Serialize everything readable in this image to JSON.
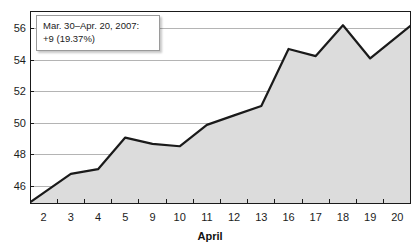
{
  "chart_data": {
    "type": "area",
    "title": "",
    "subtitle": "",
    "xlabel": "April",
    "ylabel": "",
    "categories": [
      "2",
      "3",
      "4",
      "5",
      "9",
      "10",
      "11",
      "12",
      "13",
      "16",
      "17",
      "18",
      "19",
      "20"
    ],
    "x_tick_labels": [
      "2",
      "3",
      "4",
      "5",
      "9",
      "10",
      "11",
      "12",
      "13",
      "16",
      "17",
      "18",
      "19",
      "20"
    ],
    "y_tick_labels": [
      "46",
      "48",
      "50",
      "52",
      "54",
      "56"
    ],
    "y_ticks": [
      46,
      48,
      50,
      52,
      54,
      56
    ],
    "ylim": [
      44.9,
      57.1
    ],
    "grid": true,
    "legend": false,
    "series": [
      {
        "name": "price",
        "values": [
          45.6,
          46.8,
          47.1,
          49.1,
          48.7,
          48.55,
          49.9,
          50.5,
          51.1,
          54.7,
          54.25,
          56.2,
          54.1,
          55.5
        ]
      }
    ],
    "annotations": [
      {
        "name": "range-tooltip",
        "line1": "Mar. 30–Apr. 20, 2007:",
        "line2": "+9 (19.37%)"
      }
    ],
    "colors": {
      "line": "#1a1a1a",
      "fill": "#dcdcdc",
      "grid": "#b4b4b4",
      "axis": "#1a1a1a",
      "text": "#1c1c1c",
      "tooltip_bg": "#ffffff",
      "tooltip_border": "#9a9a9a",
      "background": "#ffffff"
    }
  },
  "tooltip": {
    "line1": "Mar. 30–Apr. 20, 2007:",
    "line2": "+9 (19.37%)"
  },
  "axis": {
    "x_title": "April"
  }
}
